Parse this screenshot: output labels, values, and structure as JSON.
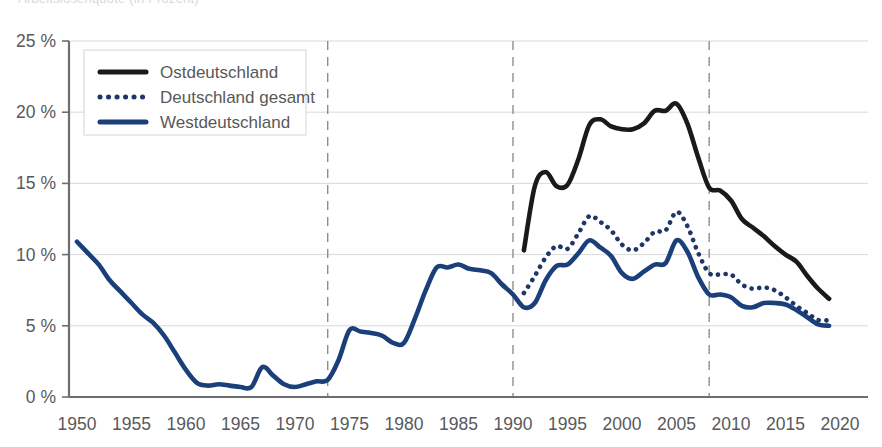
{
  "title_clipped": "Arbeitslosenquote (in Prozent)",
  "axes": {
    "y_ticks": [
      "0 %",
      "5 %",
      "10 %",
      "15 %",
      "20 %",
      "25 %"
    ],
    "x_ticks": [
      "1950",
      "1955",
      "1960",
      "1965",
      "1970",
      "1975",
      "1980",
      "1985",
      "1990",
      "1995",
      "2000",
      "2005",
      "2010",
      "2015",
      "2020"
    ]
  },
  "legend": {
    "items": [
      {
        "label": "Ostdeutschland",
        "color": "#1a1a1a",
        "style": "solid"
      },
      {
        "label": "Deutschland gesamt",
        "color": "#1f3668",
        "style": "dotted"
      },
      {
        "label": "Westdeutschland",
        "color": "#1b3f7a",
        "style": "solid"
      }
    ]
  },
  "event_markers": [
    {
      "year": 1973,
      "label": "1973"
    },
    {
      "year": 1990,
      "label": "1990"
    },
    {
      "year": 2008,
      "label": "2008"
    }
  ],
  "chart_data": {
    "type": "line",
    "title": "Arbeitslosenquote (in Prozent)",
    "xlabel": "",
    "ylabel": "",
    "xlim": [
      1949,
      2020
    ],
    "ylim": [
      0,
      25
    ],
    "y_unit": "%",
    "grid": true,
    "legend_position": "top-left",
    "vertical_markers": [
      1973,
      1990,
      2008
    ],
    "series": [
      {
        "name": "Ostdeutschland",
        "color": "#1a1a1a",
        "style": "solid",
        "x": [
          1991,
          1992,
          1993,
          1994,
          1995,
          1996,
          1997,
          1998,
          1999,
          2000,
          2001,
          2002,
          2003,
          2004,
          2005,
          2006,
          2007,
          2008,
          2009,
          2010,
          2011,
          2012,
          2013,
          2014,
          2015,
          2016,
          2017,
          2018,
          2019
        ],
        "values": [
          10.3,
          14.8,
          15.8,
          14.8,
          14.9,
          16.7,
          19.1,
          19.5,
          19.0,
          18.8,
          18.8,
          19.2,
          20.1,
          20.1,
          20.6,
          19.2,
          16.8,
          14.7,
          14.5,
          13.8,
          12.5,
          11.9,
          11.3,
          10.6,
          10.0,
          9.5,
          8.5,
          7.6,
          6.9
        ]
      },
      {
        "name": "Deutschland gesamt",
        "color": "#1f3668",
        "style": "dotted",
        "x": [
          1991,
          1992,
          1993,
          1994,
          1995,
          1996,
          1997,
          1998,
          1999,
          2000,
          2001,
          2002,
          2003,
          2004,
          2005,
          2006,
          2007,
          2008,
          2009,
          2010,
          2011,
          2012,
          2013,
          2014,
          2015,
          2016,
          2017,
          2018,
          2019
        ],
        "values": [
          7.3,
          8.5,
          9.8,
          10.6,
          10.4,
          11.5,
          12.7,
          12.3,
          11.7,
          10.7,
          10.3,
          10.8,
          11.6,
          11.7,
          13.0,
          12.0,
          10.1,
          8.7,
          8.6,
          8.6,
          7.9,
          7.6,
          7.7,
          7.5,
          7.0,
          6.4,
          5.9,
          5.4,
          5.4
        ]
      },
      {
        "name": "Westdeutschland",
        "color": "#1b3f7a",
        "style": "solid",
        "x": [
          1950,
          1951,
          1952,
          1953,
          1954,
          1955,
          1956,
          1957,
          1958,
          1959,
          1960,
          1961,
          1962,
          1963,
          1964,
          1965,
          1966,
          1967,
          1968,
          1969,
          1970,
          1971,
          1972,
          1973,
          1974,
          1975,
          1976,
          1977,
          1978,
          1979,
          1980,
          1981,
          1982,
          1983,
          1984,
          1985,
          1986,
          1987,
          1988,
          1989,
          1990,
          1991,
          1992,
          1993,
          1994,
          1995,
          1996,
          1997,
          1998,
          1999,
          2000,
          2001,
          2002,
          2003,
          2004,
          2005,
          2006,
          2007,
          2008,
          2009,
          2010,
          2011,
          2012,
          2013,
          2014,
          2015,
          2016,
          2017,
          2018,
          2019
        ],
        "values": [
          10.9,
          10.1,
          9.3,
          8.2,
          7.4,
          6.6,
          5.8,
          5.2,
          4.3,
          3.1,
          1.9,
          1.0,
          0.8,
          0.9,
          0.8,
          0.7,
          0.7,
          2.1,
          1.5,
          0.9,
          0.7,
          0.9,
          1.1,
          1.2,
          2.6,
          4.7,
          4.6,
          4.5,
          4.3,
          3.8,
          3.8,
          5.5,
          7.5,
          9.1,
          9.1,
          9.3,
          9.0,
          8.9,
          8.7,
          7.9,
          7.2,
          6.3,
          6.6,
          8.2,
          9.2,
          9.3,
          10.1,
          11.0,
          10.5,
          9.9,
          8.7,
          8.3,
          8.8,
          9.3,
          9.4,
          11.0,
          10.2,
          8.4,
          7.2,
          7.2,
          7.0,
          6.4,
          6.3,
          6.6,
          6.6,
          6.5,
          6.1,
          5.6,
          5.1,
          5.0
        ]
      }
    ]
  }
}
